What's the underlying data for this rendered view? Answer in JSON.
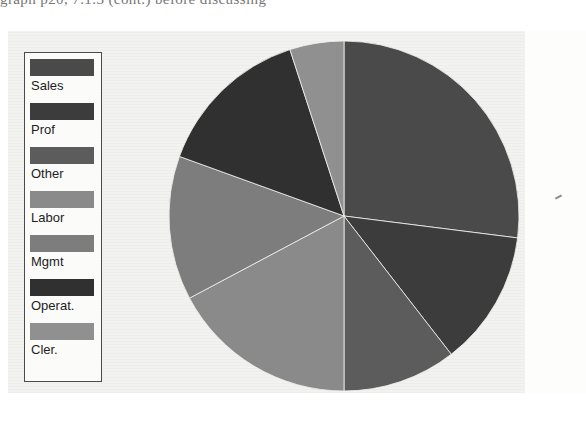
{
  "page": {
    "scan_text_line": "graph p20, 7.1.3 (cont.) before discussing",
    "background_hex": "#f2f2f0"
  },
  "legend": {
    "name": "pie-legend",
    "border_hex": "#4a4a4a",
    "items": [
      {
        "label": "Sales",
        "color": "#4a4a4a"
      },
      {
        "label": "Prof",
        "color": "#3c3c3c"
      },
      {
        "label": "Other",
        "color": "#5c5c5c"
      },
      {
        "label": "Labor",
        "color": "#8a8a8a"
      },
      {
        "label": "Mgmt",
        "color": "#7d7d7d"
      },
      {
        "label": "Operat.",
        "color": "#303030"
      },
      {
        "label": "Cler.",
        "color": "#909090"
      }
    ]
  },
  "chart_data": {
    "type": "pie",
    "title": "",
    "legend_position": "left",
    "grid": false,
    "start_angle_deg": 0,
    "direction": "clockwise",
    "categories": [
      "Sales",
      "Prof",
      "Other",
      "Labor",
      "Mgmt",
      "Operat.",
      "Cler."
    ],
    "values": [
      27.0,
      12.5,
      10.5,
      17.2,
      13.3,
      14.5,
      5.0
    ],
    "angles_deg": [
      97.2,
      45.0,
      37.8,
      62.0,
      47.9,
      52.1,
      18.0
    ],
    "colors": [
      "#4a4a4a",
      "#3c3c3c",
      "#5c5c5c",
      "#8a8a8a",
      "#7d7d7d",
      "#303030",
      "#909090"
    ],
    "xlabel": "",
    "ylabel": ""
  }
}
